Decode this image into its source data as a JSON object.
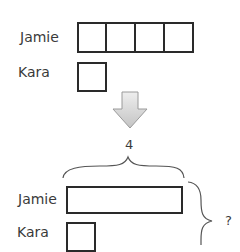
{
  "top_model": {
    "rows": [
      {
        "name": "Jamie",
        "units": 4
      },
      {
        "name": "Kara",
        "units": 1
      }
    ]
  },
  "bottom_model": {
    "rows": [
      {
        "name": "Jamie",
        "units_label": "4"
      },
      {
        "name": "Kara",
        "units_label": "1"
      }
    ],
    "top_brace_label": "4",
    "side_brace_label": "?"
  },
  "arrow": {
    "direction": "down",
    "color": "#d0d0d0"
  }
}
